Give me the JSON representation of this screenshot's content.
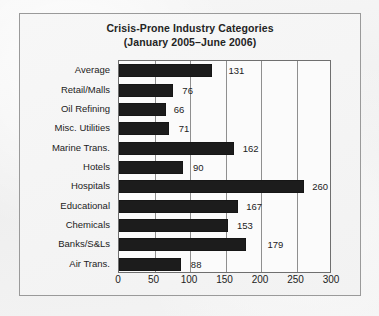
{
  "chart_data": {
    "type": "bar",
    "orientation": "horizontal",
    "title": "Crisis-Prone Industry Categories",
    "subtitle": "(January 2005–June 2006)",
    "xlabel": "",
    "ylabel": "",
    "xlim": [
      0,
      300
    ],
    "xticks": [
      0,
      50,
      100,
      150,
      200,
      250,
      300
    ],
    "grid": true,
    "legend": false,
    "bar_color": "#1c1c1c",
    "categories": [
      "Average",
      "Retail/Malls",
      "Oil Refining",
      "Misc. Utilities",
      "Marine Trans.",
      "Hotels",
      "Hospitals",
      "Educational",
      "Chemicals",
      "Banks/S&Ls",
      "Air Trans."
    ],
    "values": [
      131,
      76,
      66,
      71,
      162,
      90,
      260,
      167,
      153,
      179,
      88
    ],
    "data_labels": [
      "131",
      "76",
      "66",
      "71",
      "162",
      "90",
      "260",
      "167",
      "153",
      "179",
      "88"
    ],
    "data_label_positions": [
      150,
      85,
      73,
      80,
      170,
      100,
      268,
      175,
      162,
      205,
      97
    ]
  },
  "colors": {
    "page_background": "#f1f1f1",
    "card_background": "#f4f4f4",
    "card_border": "#9a9a9a",
    "plot_border": "#6f6f6f",
    "gridline": "#8f8f8f",
    "bar": "#1c1c1c",
    "text": "#222222"
  }
}
